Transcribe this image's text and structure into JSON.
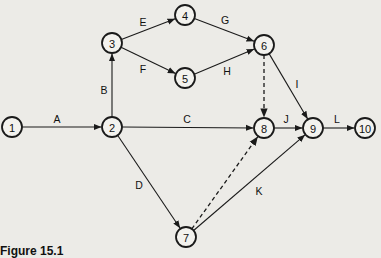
{
  "diagram": {
    "type": "activity-on-arrow network",
    "caption": "Figure 15.1",
    "nodes": [
      {
        "id": "1",
        "label": "1",
        "x": 12,
        "y": 127
      },
      {
        "id": "2",
        "label": "2",
        "x": 112,
        "y": 127
      },
      {
        "id": "3",
        "label": "3",
        "x": 112,
        "y": 43
      },
      {
        "id": "4",
        "label": "4",
        "x": 185,
        "y": 15
      },
      {
        "id": "5",
        "label": "5",
        "x": 185,
        "y": 78
      },
      {
        "id": "6",
        "label": "6",
        "x": 264,
        "y": 45
      },
      {
        "id": "7",
        "label": "7",
        "x": 186,
        "y": 237
      },
      {
        "id": "8",
        "label": "8",
        "x": 264,
        "y": 128
      },
      {
        "id": "9",
        "label": "9",
        "x": 313,
        "y": 128
      },
      {
        "id": "10",
        "label": "10",
        "x": 365,
        "y": 128
      }
    ],
    "edges": [
      {
        "from": "1",
        "to": "2",
        "label": "A",
        "style": "solid"
      },
      {
        "from": "2",
        "to": "3",
        "label": "B",
        "style": "solid"
      },
      {
        "from": "2",
        "to": "8",
        "label": "C",
        "style": "solid"
      },
      {
        "from": "2",
        "to": "7",
        "label": "D",
        "style": "solid"
      },
      {
        "from": "3",
        "to": "4",
        "label": "E",
        "style": "solid"
      },
      {
        "from": "3",
        "to": "5",
        "label": "F",
        "style": "solid"
      },
      {
        "from": "4",
        "to": "6",
        "label": "G",
        "style": "solid"
      },
      {
        "from": "5",
        "to": "6",
        "label": "H",
        "style": "solid"
      },
      {
        "from": "6",
        "to": "9",
        "label": "I",
        "style": "solid"
      },
      {
        "from": "8",
        "to": "9",
        "label": "J",
        "style": "solid"
      },
      {
        "from": "7",
        "to": "9",
        "label": "K",
        "style": "solid"
      },
      {
        "from": "9",
        "to": "10",
        "label": "L",
        "style": "solid"
      },
      {
        "from": "6",
        "to": "8",
        "label": "",
        "style": "dashed"
      },
      {
        "from": "7",
        "to": "8",
        "label": "",
        "style": "dashed"
      }
    ],
    "edge_labels": {
      "A": {
        "x": 57,
        "y": 119
      },
      "B": {
        "x": 104,
        "y": 90
      },
      "C": {
        "x": 187,
        "y": 119
      },
      "D": {
        "x": 139,
        "y": 185
      },
      "E": {
        "x": 143,
        "y": 22
      },
      "F": {
        "x": 143,
        "y": 69
      },
      "G": {
        "x": 225,
        "y": 20
      },
      "H": {
        "x": 227,
        "y": 71
      },
      "I": {
        "x": 297,
        "y": 84
      },
      "J": {
        "x": 286,
        "y": 119
      },
      "K": {
        "x": 259,
        "y": 191
      },
      "L": {
        "x": 337,
        "y": 119
      }
    }
  }
}
